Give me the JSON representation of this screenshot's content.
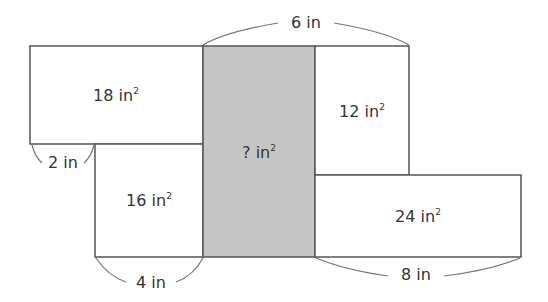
{
  "diagram": {
    "type": "area-model",
    "colors": {
      "shaded": "#c6c6c6",
      "plain": "#ffffff",
      "stroke": "#555555",
      "text": "#333333"
    },
    "rectangles": [
      {
        "id": "top-left",
        "area": "18",
        "unit": "in",
        "shaded": false
      },
      {
        "id": "bottom-left",
        "area": "16",
        "unit": "in",
        "shaded": false
      },
      {
        "id": "center",
        "area": "?",
        "unit": "in",
        "shaded": true
      },
      {
        "id": "top-right",
        "area": "12",
        "unit": "in",
        "shaded": false
      },
      {
        "id": "bottom-right",
        "area": "24",
        "unit": "in",
        "shaded": false
      }
    ],
    "dimensions": [
      {
        "id": "top-width",
        "label": "6 in"
      },
      {
        "id": "left-gap",
        "label": "2 in"
      },
      {
        "id": "bottom-left-width",
        "label": "4 in"
      },
      {
        "id": "bottom-right-width",
        "label": "8 in"
      }
    ],
    "exponent": "2"
  }
}
